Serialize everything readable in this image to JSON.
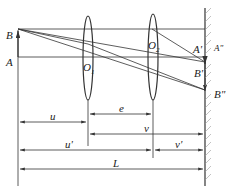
{
  "diagram": {
    "points": {
      "B": "B",
      "A": "A",
      "O1": "O",
      "O1_sub": "1",
      "O2": "O",
      "O2_sub": "2",
      "A_prime": "A'",
      "A_double_prime": "A\"",
      "B_prime": "B'",
      "B_double_prime": "B\""
    },
    "dimensions": {
      "e": "e",
      "u": "u",
      "v": "v",
      "u_prime": "u'",
      "v_prime": "v'",
      "L": "L"
    },
    "colors": {
      "line": "#333333",
      "hatch": "#999999"
    }
  }
}
